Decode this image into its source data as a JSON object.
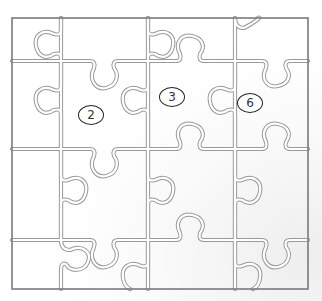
{
  "puzzle": {
    "title": "",
    "grid": {
      "columns": 4,
      "rows": 4
    },
    "frame": {
      "x": 12,
      "y": 18,
      "width": 296,
      "height": 271,
      "color": "#7a7a7a"
    },
    "line_color": "#9a9a9a",
    "pieces_labeled": [
      {
        "label": "2",
        "x": 78,
        "y": 105
      },
      {
        "label": "3",
        "x": 159,
        "y": 87
      },
      {
        "label": "6",
        "x": 237,
        "y": 93
      }
    ]
  }
}
